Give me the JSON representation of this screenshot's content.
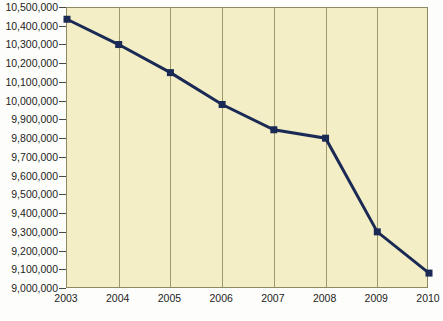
{
  "chart_data": {
    "type": "line",
    "title": "",
    "subtitle": "",
    "xlabel": "",
    "ylabel": "",
    "categories": [
      "2003",
      "2004",
      "2005",
      "2006",
      "2007",
      "2008",
      "2009",
      "2010"
    ],
    "x": [
      2003,
      2004,
      2005,
      2006,
      2007,
      2008,
      2009,
      2010
    ],
    "values": [
      10440000,
      10305000,
      10155000,
      9985000,
      9850000,
      9805000,
      9305000,
      9085000
    ],
    "series": [
      {
        "name": "",
        "values": [
          10440000,
          10305000,
          10155000,
          9985000,
          9850000,
          9805000,
          9305000,
          9085000
        ]
      }
    ],
    "ylim": [
      9000000,
      10500000
    ],
    "ytick_step": 100000,
    "ytick_labels": [
      "10,500,000",
      "10,400,000",
      "10,300,000",
      "10,200,000",
      "10,100,000",
      "10,000,000",
      "9,900,000",
      "9,800,000",
      "9,700,000",
      "9,600,000",
      "9,500,000",
      "9,400,000",
      "9,300,000",
      "9,200,000",
      "9,100,000",
      "9,000,000"
    ],
    "ytick_values": [
      10500000,
      10400000,
      10300000,
      10200000,
      10100000,
      10000000,
      9900000,
      9800000,
      9700000,
      9600000,
      9500000,
      9400000,
      9300000,
      9200000,
      9100000,
      9000000
    ],
    "grid": {
      "vertical": true,
      "horizontal": false
    },
    "legend": {
      "visible": false,
      "position": "none",
      "entries": []
    },
    "annotations": [],
    "colors": {
      "plot_background": "#f3eec6",
      "plot_border": "#8d8a63",
      "gridline": "#9d9769",
      "series_line": "#1b2a55",
      "marker": "#1b2a55",
      "axis_text": "#1d1d1b",
      "page_background": "#fdfdfb"
    },
    "style": {
      "line_width_px": 3,
      "marker_shape": "square",
      "marker_size_px": 7
    }
  }
}
